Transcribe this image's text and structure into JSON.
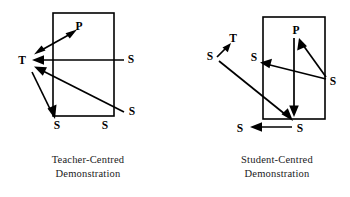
{
  "figure": {
    "background_color": "#ffffff",
    "ink_color": "#000000",
    "panels": [
      {
        "id": "teacher-centred",
        "caption_line1": "Teacher-Centred",
        "caption_line2": "Demonstration",
        "labels": [
          {
            "key": "p",
            "text": "P",
            "x": 79,
            "y": 27
          },
          {
            "key": "t",
            "text": "T",
            "x": 22,
            "y": 61
          },
          {
            "key": "s-right-mid",
            "text": "S",
            "x": 131,
            "y": 60
          },
          {
            "key": "s-right-low",
            "text": "S",
            "x": 132,
            "y": 112
          },
          {
            "key": "s-bottom-left",
            "text": "S",
            "x": 57,
            "y": 126
          },
          {
            "key": "s-bottom-mid",
            "text": "S",
            "x": 105,
            "y": 126
          }
        ],
        "box": {
          "x": 53,
          "y": 13,
          "width": 61,
          "height": 103
        },
        "arrows": [
          {
            "key": "p-to-t-double",
            "from": [
              75,
              31
            ],
            "to": [
              36,
              53
            ],
            "heads": "both"
          },
          {
            "key": "s-right-mid-to-t",
            "from": [
              124,
              60
            ],
            "to": [
              33,
              60
            ],
            "heads": "end"
          },
          {
            "key": "s-right-low-to-t",
            "from": [
              124,
              112
            ],
            "to": [
              36,
              68
            ],
            "heads": "end"
          },
          {
            "key": "t-to-s-bottom-left",
            "from": [
              32,
              72
            ],
            "to": [
              54,
              117
            ],
            "heads": "end"
          }
        ]
      },
      {
        "id": "student-centred",
        "caption_line1": "Student-Centred",
        "caption_line2": "Demonstration",
        "labels": [
          {
            "key": "t",
            "text": "T",
            "x": 233,
            "y": 39
          },
          {
            "key": "s-far-left",
            "text": "S",
            "x": 210,
            "y": 57
          },
          {
            "key": "p",
            "text": "P",
            "x": 296,
            "y": 31
          },
          {
            "key": "s-inner-left",
            "text": "S",
            "x": 254,
            "y": 58
          },
          {
            "key": "s-right",
            "text": "S",
            "x": 333,
            "y": 82
          },
          {
            "key": "s-bottom-left",
            "text": "S",
            "x": 240,
            "y": 129
          },
          {
            "key": "s-bottom-right",
            "text": "S",
            "x": 300,
            "y": 129
          }
        ],
        "box": {
          "x": 263,
          "y": 17,
          "width": 62,
          "height": 102
        },
        "arrows": [
          {
            "key": "s-far-left-to-t",
            "from": [
              218,
              56
            ],
            "to": [
              229,
              44
            ],
            "heads": "end"
          },
          {
            "key": "t-down-to-s-bottom-right",
            "from": [
              220,
              62
            ],
            "to": [
              292,
              120
            ],
            "heads": "end"
          },
          {
            "key": "p-down",
            "from": [
              294,
              38
            ],
            "to": [
              294,
              116
            ],
            "heads": "end"
          },
          {
            "key": "s-right-to-p",
            "from": [
              326,
              77
            ],
            "to": [
              299,
              39
            ],
            "heads": "end"
          },
          {
            "key": "s-right-to-inner-left",
            "from": [
              326,
              79
            ],
            "to": [
              261,
              63
            ],
            "heads": "end"
          },
          {
            "key": "s-bottom-right-to-s-bottom-left",
            "from": [
              292,
              127
            ],
            "to": [
              251,
              127
            ],
            "heads": "end"
          }
        ]
      }
    ]
  }
}
